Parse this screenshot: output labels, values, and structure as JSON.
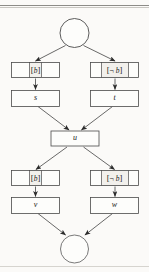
{
  "diagram": {
    "type": "activity-diagram",
    "stroke_color": "#3b3b3b",
    "fill_color": "#fdfdfb",
    "background_color": "#fbfaf8",
    "nodes": {
      "start": {
        "kind": "circle",
        "label": ""
      },
      "guard_b_top": {
        "kind": "guard-box",
        "bracket_open": "[",
        "bracket_close": "]",
        "expression": "b",
        "negation": ""
      },
      "guard_notb_top": {
        "kind": "guard-box",
        "bracket_open": "[",
        "bracket_close": "]",
        "expression": "b",
        "negation": "¬"
      },
      "action_s": {
        "kind": "box",
        "label": "s"
      },
      "action_t": {
        "kind": "box",
        "label": "t"
      },
      "action_u": {
        "kind": "box",
        "label": "u"
      },
      "guard_b_bottom": {
        "kind": "guard-box",
        "bracket_open": "[",
        "bracket_close": "]",
        "expression": "b",
        "negation": ""
      },
      "guard_notb_bottom": {
        "kind": "guard-box",
        "bracket_open": "[",
        "bracket_close": "]",
        "expression": "b",
        "negation": "¬"
      },
      "action_v": {
        "kind": "box",
        "label": "v"
      },
      "action_w": {
        "kind": "box",
        "label": "w"
      },
      "end": {
        "kind": "circle",
        "label": ""
      }
    },
    "edges": [
      {
        "from": "start",
        "to": "guard_b_top"
      },
      {
        "from": "start",
        "to": "guard_notb_top"
      },
      {
        "from": "guard_b_top",
        "to": "action_s"
      },
      {
        "from": "guard_notb_top",
        "to": "action_t"
      },
      {
        "from": "action_s",
        "to": "action_u"
      },
      {
        "from": "action_t",
        "to": "action_u"
      },
      {
        "from": "action_u",
        "to": "guard_b_bottom"
      },
      {
        "from": "action_u",
        "to": "guard_notb_bottom"
      },
      {
        "from": "guard_b_bottom",
        "to": "action_v"
      },
      {
        "from": "guard_notb_bottom",
        "to": "action_w"
      },
      {
        "from": "action_v",
        "to": "end"
      },
      {
        "from": "action_w",
        "to": "end"
      }
    ]
  }
}
